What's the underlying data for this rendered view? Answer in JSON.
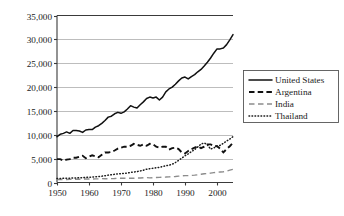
{
  "chart_data": {
    "type": "line",
    "title": "",
    "subtitle": "",
    "xlabel": "",
    "ylabel": "",
    "grid": true,
    "legend_position": "right",
    "xlim": [
      1950,
      2005
    ],
    "ylim": [
      0,
      35000
    ],
    "x_ticks": [
      1950,
      1960,
      1970,
      1980,
      1990,
      2000
    ],
    "x_tick_labels": [
      "1950",
      "1960",
      "1970",
      "1980",
      "1990",
      "2000"
    ],
    "y_ticks": [
      0,
      5000,
      10000,
      15000,
      20000,
      25000,
      30000,
      35000
    ],
    "y_tick_labels": [
      "0",
      "5,000",
      "10,000",
      "15,000",
      "20,000",
      "25,000",
      "30,000",
      "35,000"
    ],
    "x": [
      1950,
      1951,
      1952,
      1953,
      1954,
      1955,
      1956,
      1957,
      1958,
      1959,
      1960,
      1961,
      1962,
      1963,
      1964,
      1965,
      1966,
      1967,
      1968,
      1969,
      1970,
      1971,
      1972,
      1973,
      1974,
      1975,
      1976,
      1977,
      1978,
      1979,
      1980,
      1981,
      1982,
      1983,
      1984,
      1985,
      1986,
      1987,
      1988,
      1989,
      1990,
      1991,
      1992,
      1993,
      1994,
      1995,
      1996,
      1997,
      1998,
      1999,
      2000,
      2001,
      2002,
      2003,
      2004,
      2005
    ],
    "series": [
      {
        "name": "United States",
        "style": "solid",
        "color": "#111111",
        "values": [
          9600,
          10100,
          10300,
          10600,
          10300,
          10900,
          10900,
          10800,
          10500,
          11000,
          11100,
          11100,
          11600,
          11900,
          12400,
          13000,
          13700,
          13900,
          14400,
          14700,
          14500,
          14800,
          15400,
          16100,
          15800,
          15600,
          16300,
          16900,
          17600,
          17900,
          17700,
          17900,
          17300,
          17900,
          19000,
          19600,
          20000,
          20600,
          21300,
          21900,
          22100,
          21700,
          22200,
          22600,
          23200,
          23700,
          24400,
          25200,
          26100,
          27100,
          28000,
          28000,
          28200,
          28900,
          29900,
          31000
        ]
      },
      {
        "name": "Argentina",
        "style": "dashed-bold",
        "color": "#111111",
        "values": [
          4900,
          4900,
          4600,
          4800,
          4900,
          5200,
          5200,
          5400,
          5600,
          5100,
          5400,
          5700,
          5500,
          5300,
          5800,
          6300,
          6300,
          6400,
          6700,
          7100,
          7300,
          7500,
          7500,
          7700,
          8100,
          7900,
          7700,
          8000,
          7700,
          8100,
          8000,
          7500,
          7300,
          7500,
          7500,
          6900,
          7200,
          7300,
          7000,
          6300,
          6100,
          6600,
          7000,
          7300,
          7600,
          7200,
          7500,
          8000,
          8000,
          7700,
          7600,
          7100,
          6300,
          7000,
          7600,
          8300
        ]
      },
      {
        "name": "India",
        "style": "dashed-light",
        "color": "#8c8c8c",
        "values": [
          600,
          610,
          620,
          640,
          660,
          680,
          700,
          690,
          720,
          730,
          740,
          740,
          750,
          770,
          810,
          790,
          780,
          820,
          840,
          880,
          910,
          900,
          880,
          900,
          890,
          940,
          940,
          980,
          1030,
          970,
          1010,
          1050,
          1070,
          1120,
          1140,
          1180,
          1220,
          1250,
          1330,
          1390,
          1450,
          1440,
          1490,
          1540,
          1620,
          1720,
          1820,
          1880,
          1960,
          2080,
          2140,
          2200,
          2250,
          2400,
          2580,
          2750
        ]
      },
      {
        "name": "Thailand",
        "style": "dotted",
        "color": "#1a1a1a",
        "values": [
          820,
          840,
          870,
          910,
          900,
          960,
          960,
          990,
          1000,
          1060,
          1100,
          1140,
          1200,
          1260,
          1320,
          1420,
          1540,
          1620,
          1720,
          1820,
          1860,
          1930,
          1980,
          2120,
          2200,
          2280,
          2420,
          2580,
          2780,
          2900,
          2980,
          3100,
          3180,
          3350,
          3500,
          3620,
          3820,
          4180,
          4640,
          5110,
          5600,
          6000,
          6450,
          6900,
          7450,
          8050,
          8300,
          7900,
          7000,
          7250,
          7600,
          7800,
          8200,
          8700,
          9100,
          9600
        ]
      }
    ],
    "legend": [
      {
        "label": "United States",
        "style": "solid"
      },
      {
        "label": "Argentina",
        "style": "dashed-bold"
      },
      {
        "label": "India",
        "style": "dashed-light"
      },
      {
        "label": "Thailand",
        "style": "dotted"
      }
    ]
  }
}
